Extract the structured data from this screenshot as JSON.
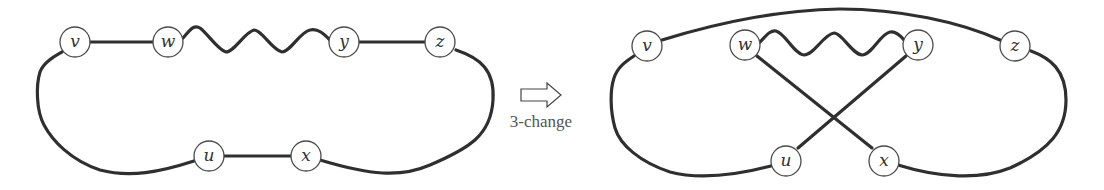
{
  "figure": {
    "before": {
      "nodes": [
        {
          "id": "v",
          "label": "v"
        },
        {
          "id": "w",
          "label": "w"
        },
        {
          "id": "y",
          "label": "y"
        },
        {
          "id": "z",
          "label": "z"
        },
        {
          "id": "u",
          "label": "u"
        },
        {
          "id": "x",
          "label": "x"
        }
      ],
      "edges": [
        "v-w",
        "w~y (path)",
        "y-z",
        "z..x (path)",
        "x-u",
        "u..v (path)"
      ]
    },
    "transition": {
      "label": "3-change"
    },
    "after": {
      "nodes": [
        {
          "id": "v",
          "label": "v"
        },
        {
          "id": "w",
          "label": "w"
        },
        {
          "id": "y",
          "label": "y"
        },
        {
          "id": "z",
          "label": "z"
        },
        {
          "id": "u",
          "label": "u"
        },
        {
          "id": "x",
          "label": "x"
        }
      ],
      "edges": [
        "v-z",
        "w~y (path)",
        "w-x",
        "y-u",
        "z..x (path)",
        "u..v (path)"
      ]
    }
  }
}
